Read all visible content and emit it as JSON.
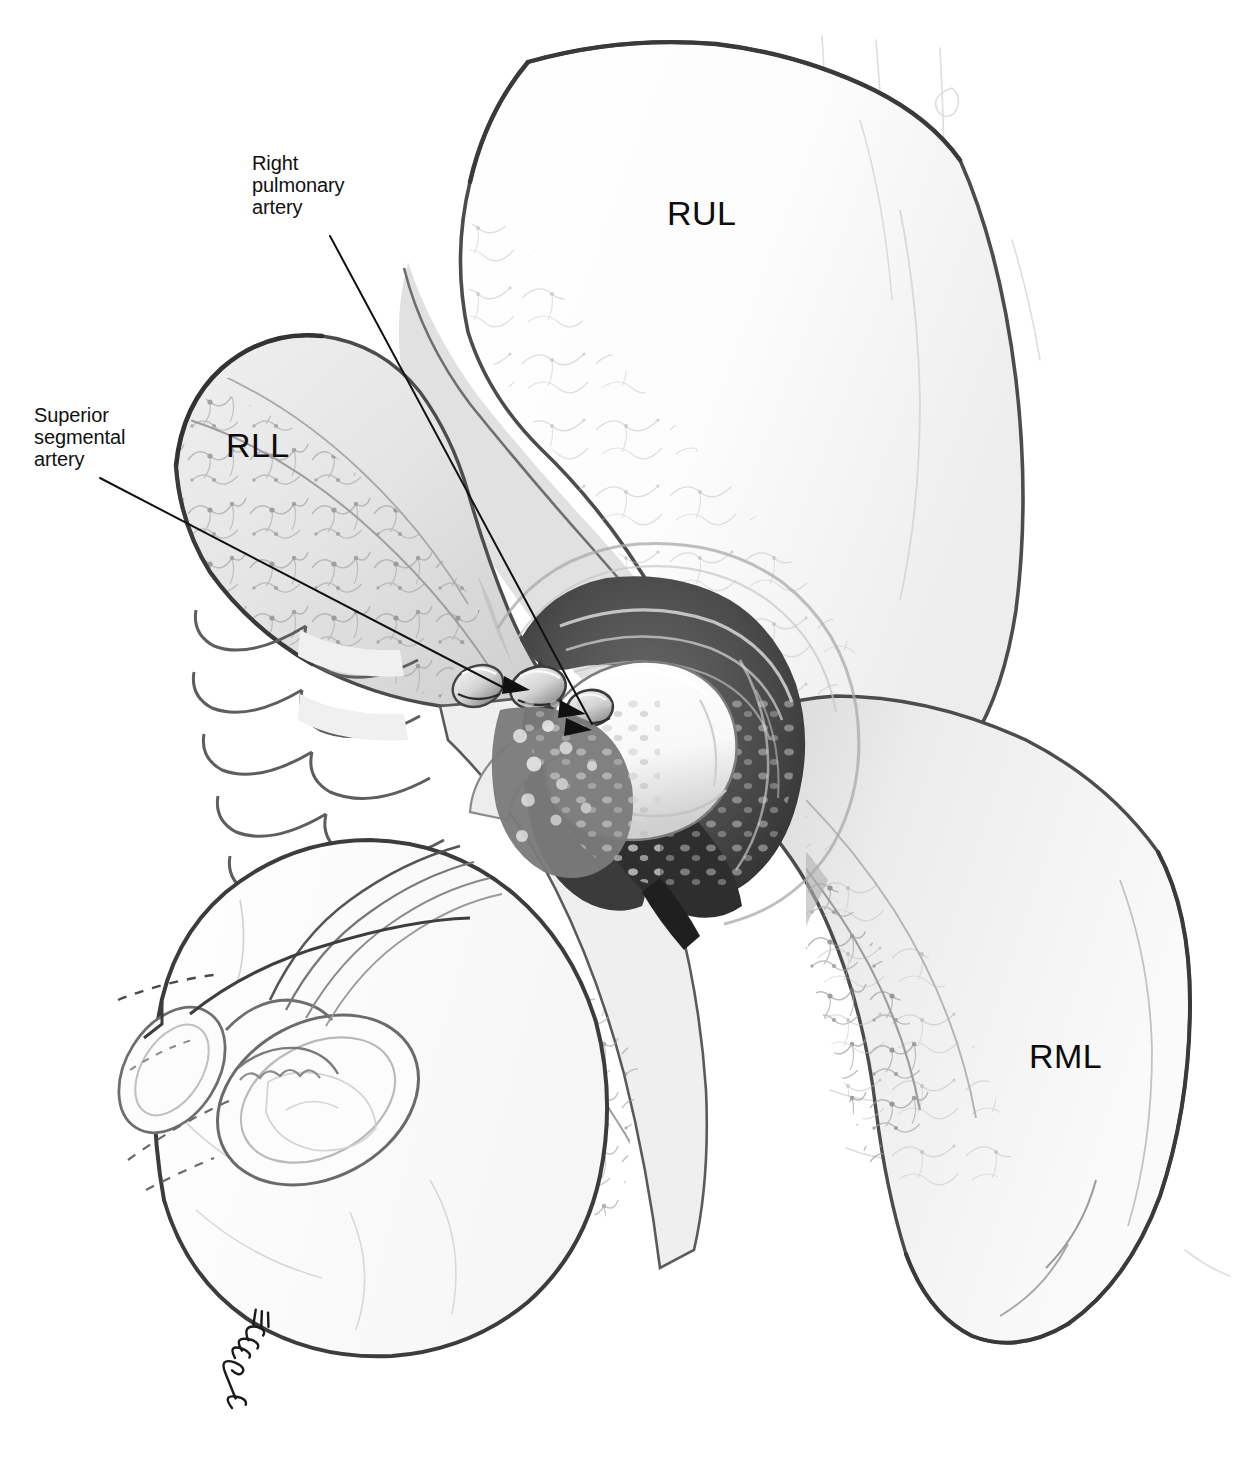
{
  "figure": {
    "kind": "medical-surgical-illustration",
    "view": "anterior-lateral operative view of right lung",
    "background_color": "#ffffff",
    "ink_color": "#111111",
    "width": 1242,
    "height": 1466
  },
  "annotations": {
    "right_pulmonary_artery": {
      "text": "Right\npulmonary\nartery",
      "lines": [
        "Right",
        "pulmonary",
        "artery"
      ]
    },
    "superior_segmental_artery": {
      "text": "Superior\nsegmental\nartery",
      "lines": [
        "Superior",
        "segmental",
        "artery"
      ]
    }
  },
  "lobe_labels": {
    "rul": "RUL",
    "rll": "RLL",
    "rml": "RML"
  },
  "signature": {
    "text": "A. Thomas",
    "style": "cursive-handwritten"
  },
  "palette": {
    "paper": "#ffffff",
    "outline_dark": "#1a1a1a",
    "outline_mid": "#585858",
    "outline_soft": "#9a9a9a",
    "lung_fill_light": "#f4f4f4",
    "lung_fill_mid": "#e2e2e2",
    "lung_shadow": "#c6c6c6",
    "fissure_shade": "#b5b5b5",
    "hilum_dark": "#4a4a4a",
    "hilum_darker": "#313131",
    "artery_white": "#fbfbfb",
    "artery_shade": "#d8d8d8",
    "vessel_line": "#8c8c8c",
    "faint_line": "#d0d0d0"
  },
  "structures": [
    {
      "name": "right-upper-lobe",
      "abbr": "RUL",
      "role": "lung lobe, retracted superiorly"
    },
    {
      "name": "right-lower-lobe",
      "abbr": "RLL",
      "role": "lung lobe, retracted posteriorly"
    },
    {
      "name": "right-middle-lobe",
      "abbr": "RML",
      "role": "lung lobe, inferior-lateral"
    },
    {
      "name": "right-pulmonary-artery",
      "role": "main arterial trunk in hilum"
    },
    {
      "name": "superior-segmental-artery",
      "role": "branch to superior segment of RLL"
    },
    {
      "name": "ligated-vessel-stumps",
      "role": "divided arterial branches with ties"
    },
    {
      "name": "hilar-tissue",
      "role": "peribronchial and nodal tissue"
    },
    {
      "name": "cut-bronchus",
      "role": "transected bronchus cross-sections"
    },
    {
      "name": "pericardium-mediastinum",
      "role": "scalloped medial border"
    }
  ]
}
